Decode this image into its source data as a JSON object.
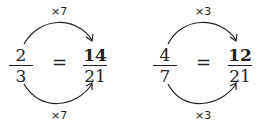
{
  "diagram": {
    "type": "equivalent-fractions",
    "examples": [
      {
        "left": {
          "numerator": "2",
          "denominator": "3"
        },
        "equals": "=",
        "right": {
          "numerator": "14",
          "denominator": "21"
        },
        "top_multiplier": "×7",
        "bottom_multiplier": "×7"
      },
      {
        "left": {
          "numerator": "4",
          "denominator": "7"
        },
        "equals": "=",
        "right": {
          "numerator": "12",
          "denominator": "21"
        },
        "top_multiplier": "×3",
        "bottom_multiplier": "×3"
      }
    ],
    "colors": {
      "ink": "#231f20",
      "background": "#ffffff"
    }
  }
}
